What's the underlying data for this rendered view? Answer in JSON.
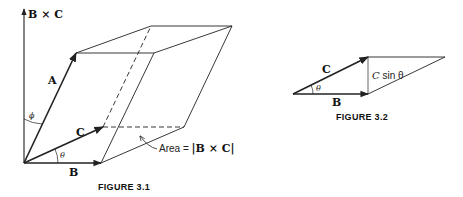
{
  "figure_3_1": {
    "caption": "FIGURE 3.1",
    "labels": {
      "axis": "B × C",
      "vector_a": "A",
      "vector_b": "B",
      "vector_c": "C",
      "angle_phi": "ϕ",
      "angle_theta": "θ",
      "area_prefix": "Area = ",
      "area_expr": "|B × C|"
    }
  },
  "figure_3_2": {
    "caption": "FIGURE 3.2",
    "labels": {
      "vector_b": "B",
      "vector_c": "C",
      "angle_theta": "θ",
      "height_c": "C",
      "height_sin": " sin θ"
    }
  },
  "colors": {
    "line": "#222222",
    "background": "#ffffff"
  }
}
